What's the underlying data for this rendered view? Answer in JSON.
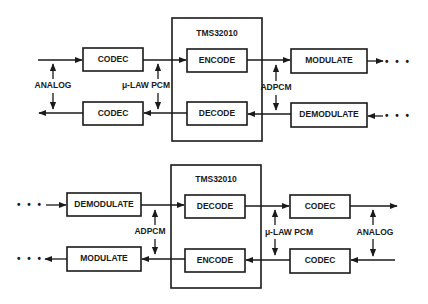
{
  "diagrams": [
    {
      "name": "transmit-receive-top",
      "chip_label": "TMS32010",
      "blocks": {
        "codec_top": "CODEC",
        "codec_bottom": "CODEC",
        "encode": "ENCODE",
        "decode": "DECODE",
        "modulate": "MODULATE",
        "demodulate": "DEMODULATE"
      },
      "signals": {
        "analog": "ANALOG",
        "pcm": "μ-LAW PCM",
        "adpcm": "ADPCM"
      },
      "continuation": "• • •"
    },
    {
      "name": "receive-transmit-bottom",
      "chip_label": "TMS32010",
      "blocks": {
        "demodulate": "DEMODULATE",
        "modulate": "MODULATE",
        "decode": "DECODE",
        "encode": "ENCODE",
        "codec_top": "CODEC",
        "codec_bottom": "CODEC"
      },
      "signals": {
        "adpcm": "ADPCM",
        "pcm": "μ-LAW PCM",
        "analog": "ANALOG"
      },
      "continuation": "• • •"
    }
  ],
  "colors": {
    "ink": "#1a1a1a",
    "background": "#ffffff"
  }
}
